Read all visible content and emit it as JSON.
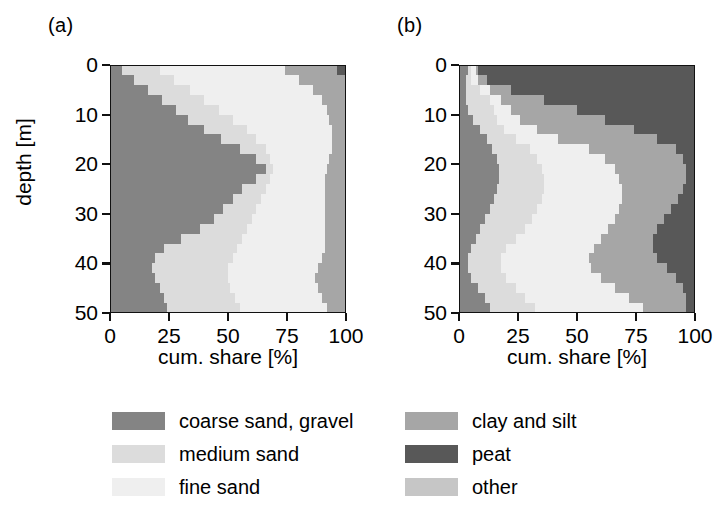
{
  "figure": {
    "panels": [
      {
        "id": "a",
        "label": "(a)"
      },
      {
        "id": "b",
        "label": "(b)"
      }
    ],
    "axes": {
      "x_title": "cum. share [%]",
      "y_title": "depth [m]",
      "x_ticks": [
        0,
        25,
        50,
        75,
        100
      ],
      "y_ticks": [
        0,
        10,
        20,
        30,
        40,
        50
      ],
      "xlim": [
        0,
        100
      ],
      "ylim": [
        0,
        50
      ],
      "y_inverted": true,
      "grid": false
    },
    "legend": {
      "position": "below",
      "columns": [
        {
          "items": [
            {
              "label": "coarse sand, gravel",
              "color": "#848484",
              "key": "coarse_sand_gravel"
            },
            {
              "label": "medium sand",
              "color": "#dcdcdc",
              "key": "medium_sand"
            },
            {
              "label": "fine sand",
              "color": "#efefef",
              "key": "fine_sand"
            }
          ]
        },
        {
          "items": [
            {
              "label": "clay and silt",
              "color": "#a6a6a6",
              "key": "clay_and_silt"
            },
            {
              "label": "peat",
              "color": "#585858",
              "key": "peat"
            },
            {
              "label": "other",
              "color": "#c6c6c6",
              "key": "other"
            }
          ]
        }
      ]
    }
  },
  "chart_data": [
    {
      "type": "area",
      "panel": "a",
      "title": "(a)",
      "xlabel": "cum. share [%]",
      "ylabel": "depth [m]",
      "orientation": "horizontal-stacked",
      "xlim": [
        0,
        100
      ],
      "ylim": [
        0,
        50
      ],
      "y_inverted": true,
      "x": [
        0,
        2,
        4,
        6,
        8,
        10,
        12,
        14,
        16,
        18,
        20,
        22,
        24,
        26,
        28,
        30,
        32,
        34,
        36,
        38,
        40,
        42,
        44,
        46,
        48,
        50
      ],
      "x_name": "depth [m]",
      "stack_order": [
        "coarse sand, gravel",
        "medium sand",
        "fine sand",
        "clay and silt",
        "peat",
        "other"
      ],
      "series": [
        {
          "name": "coarse sand, gravel",
          "color": "#848484",
          "values": [
            5,
            10,
            16,
            22,
            28,
            33,
            40,
            47,
            55,
            62,
            66,
            62,
            56,
            52,
            48,
            44,
            38,
            30,
            23,
            19,
            18,
            19,
            21,
            23,
            24,
            25
          ]
        },
        {
          "name": "medium sand",
          "color": "#dcdcdc",
          "values": [
            21,
            27,
            34,
            40,
            46,
            52,
            58,
            62,
            66,
            68,
            69,
            68,
            66,
            64,
            62,
            60,
            58,
            56,
            54,
            52,
            50,
            50,
            51,
            53,
            55,
            57
          ]
        },
        {
          "name": "fine sand",
          "color": "#efefef",
          "values": [
            74,
            80,
            86,
            90,
            92,
            93,
            94,
            94,
            94,
            93,
            92,
            91,
            91,
            91,
            91,
            91,
            91,
            91,
            91,
            90,
            88,
            87,
            88,
            90,
            92,
            94
          ]
        },
        {
          "name": "clay and silt",
          "color": "#a6a6a6",
          "values": [
            96,
            100,
            100,
            100,
            100,
            100,
            100,
            100,
            100,
            100,
            100,
            100,
            100,
            100,
            100,
            100,
            100,
            100,
            100,
            100,
            100,
            100,
            100,
            100,
            100,
            100
          ]
        },
        {
          "name": "peat",
          "color": "#585858",
          "values": [
            100,
            100,
            100,
            100,
            100,
            100,
            100,
            100,
            100,
            100,
            100,
            100,
            100,
            100,
            100,
            100,
            100,
            100,
            100,
            100,
            100,
            100,
            100,
            100,
            100,
            100
          ]
        },
        {
          "name": "other",
          "color": "#c6c6c6",
          "values": [
            100,
            100,
            100,
            100,
            100,
            100,
            100,
            100,
            100,
            100,
            100,
            100,
            100,
            100,
            100,
            100,
            100,
            100,
            100,
            100,
            100,
            100,
            100,
            100,
            100,
            100
          ]
        }
      ]
    },
    {
      "type": "area",
      "panel": "b",
      "title": "(b)",
      "xlabel": "cum. share [%]",
      "ylabel": "depth [m]",
      "orientation": "horizontal-stacked",
      "xlim": [
        0,
        100
      ],
      "ylim": [
        0,
        50
      ],
      "y_inverted": true,
      "x": [
        0,
        2,
        4,
        6,
        8,
        10,
        12,
        14,
        16,
        18,
        20,
        22,
        24,
        26,
        28,
        30,
        32,
        34,
        36,
        38,
        40,
        42,
        44,
        46,
        48,
        50
      ],
      "x_name": "depth [m]",
      "stack_order": [
        "coarse sand, gravel",
        "medium sand",
        "fine sand",
        "clay and silt",
        "peat",
        "other"
      ],
      "series": [
        {
          "name": "coarse sand, gravel",
          "color": "#848484",
          "values": [
            4,
            3,
            3,
            3,
            4,
            6,
            9,
            12,
            14,
            16,
            17,
            17,
            16,
            15,
            13,
            11,
            9,
            7,
            5,
            4,
            4,
            5,
            8,
            11,
            13,
            14
          ]
        },
        {
          "name": "medium sand",
          "color": "#dcdcdc",
          "values": [
            5,
            5,
            9,
            13,
            15,
            16,
            19,
            24,
            30,
            33,
            35,
            36,
            36,
            35,
            33,
            31,
            28,
            24,
            20,
            18,
            18,
            20,
            24,
            28,
            32,
            35
          ]
        },
        {
          "name": "fine sand",
          "color": "#efefef",
          "values": [
            7,
            8,
            13,
            18,
            22,
            26,
            33,
            42,
            55,
            62,
            66,
            68,
            69,
            69,
            68,
            66,
            63,
            60,
            57,
            55,
            56,
            60,
            66,
            72,
            78,
            84
          ]
        },
        {
          "name": "clay and silt",
          "color": "#a6a6a6",
          "values": [
            8,
            12,
            22,
            36,
            50,
            62,
            74,
            84,
            92,
            95,
            96,
            96,
            95,
            93,
            90,
            87,
            84,
            82,
            82,
            84,
            88,
            92,
            95,
            96,
            96,
            96
          ]
        },
        {
          "name": "peat",
          "color": "#585858",
          "values": [
            100,
            100,
            100,
            100,
            100,
            100,
            100,
            100,
            100,
            100,
            100,
            100,
            100,
            100,
            100,
            100,
            100,
            100,
            100,
            100,
            100,
            100,
            100,
            100,
            100,
            100
          ]
        },
        {
          "name": "other",
          "color": "#c6c6c6",
          "values": [
            100,
            100,
            100,
            100,
            100,
            100,
            100,
            100,
            100,
            100,
            100,
            100,
            100,
            100,
            100,
            100,
            100,
            100,
            100,
            100,
            100,
            100,
            100,
            100,
            100,
            100
          ]
        }
      ]
    }
  ]
}
